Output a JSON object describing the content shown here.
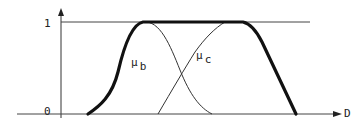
{
  "diagram": {
    "type": "fuzzy-membership-functions",
    "y_axis": {
      "ticks": [
        {
          "label": "1",
          "level": 1
        },
        {
          "label": "0",
          "level": 0
        }
      ]
    },
    "x_axis": {
      "label": "D"
    },
    "curves": [
      {
        "name": "union",
        "style": "thick",
        "description": "max of mu_b and mu_c"
      },
      {
        "name": "mu_b",
        "symbol": "μ",
        "subscript": "b",
        "style": "thin"
      },
      {
        "name": "mu_c",
        "symbol": "μ",
        "subscript": "c",
        "style": "thin"
      }
    ],
    "colors": {
      "line": "#1a1a1a",
      "thin_line": "#333333",
      "background": "#ffffff"
    }
  }
}
